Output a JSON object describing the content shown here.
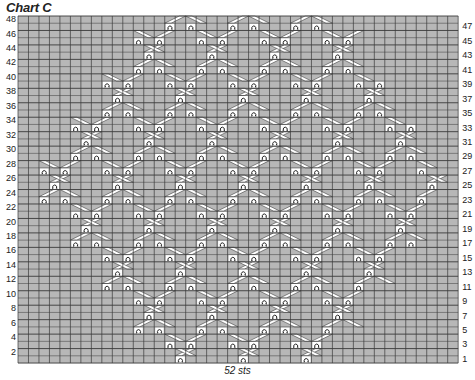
{
  "title": "Chart C",
  "caption": "52 sts",
  "grid": {
    "cols": 42,
    "rows": 48,
    "left": 18,
    "top": 16,
    "cell_w": 10.48,
    "cell_h": 7.23,
    "background": "#b7b7b7",
    "line_color": "#3a3a3a",
    "cable_color": "#ffffff"
  },
  "row_labels_left": [
    48,
    46,
    44,
    42,
    40,
    38,
    36,
    34,
    32,
    30,
    28,
    26,
    24,
    22,
    20,
    18,
    16,
    14,
    12,
    10,
    8,
    6,
    4,
    2
  ],
  "row_labels_right": [
    47,
    45,
    43,
    41,
    39,
    37,
    35,
    33,
    31,
    29,
    27,
    25,
    23,
    21,
    19,
    17,
    15,
    13,
    11,
    9,
    7,
    5,
    3,
    1
  ],
  "envelope": [
    {
      "row": 1,
      "from": 13,
      "to": 29
    },
    {
      "row": 12,
      "from": 7,
      "to": 35
    },
    {
      "row": 22,
      "from": 2,
      "to": 40
    },
    {
      "row": 28,
      "from": 2,
      "to": 40
    },
    {
      "row": 38,
      "from": 7,
      "to": 35
    },
    {
      "row": 48,
      "from": 11,
      "to": 31
    }
  ],
  "lattice": {
    "period_cols": 12,
    "offset_col": 3,
    "rows_per_col": 2
  },
  "symbols": {
    "purl": "purl-bump",
    "cable": "cable-cross"
  }
}
